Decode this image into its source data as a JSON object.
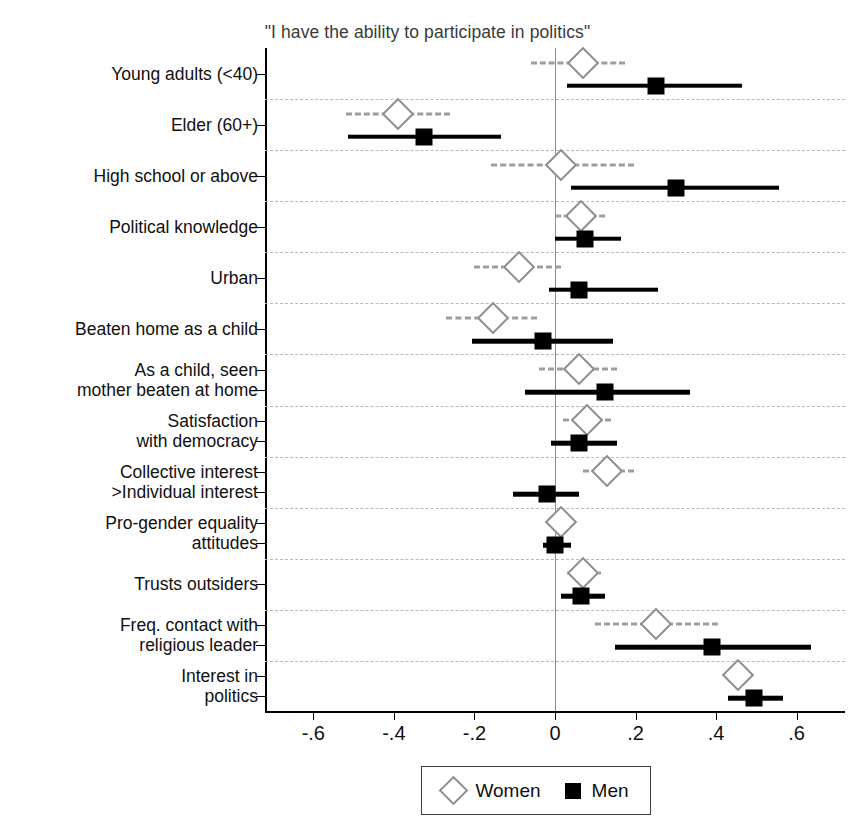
{
  "chart_data": {
    "type": "scatter",
    "title": "\"I have the ability to participate in politics\"",
    "xlabel": "",
    "ylabel": "",
    "xlim": [
      -0.72,
      0.72
    ],
    "xticks": [
      -0.6,
      -0.4,
      -0.2,
      0,
      0.2,
      0.4,
      0.6
    ],
    "xticklabels": [
      "-.6",
      "-.4",
      "-.2",
      "0",
      ".2",
      ".4",
      ".6"
    ],
    "grid": "horizontal-dashed",
    "legend_position": "bottom",
    "zero_reference_line": 0,
    "categories": [
      "Young adults (<40)",
      "Elder (60+)",
      "High school or above",
      "Political knowledge",
      "Urban",
      "Beaten home as a child",
      "As a child, seen\nmother beaten at home",
      "Satisfaction\nwith democracy",
      "Collective interest\n>Individual interest",
      "Pro-gender equality\nattitudes",
      "Trusts outsiders",
      "Freq. contact with\nreligious leader",
      "Interest in\npolitics"
    ],
    "series": [
      {
        "name": "Women",
        "marker": "open-diamond",
        "color": "#8d8d8d",
        "ci_style": "dashed",
        "values": [
          0.07,
          -0.39,
          0.015,
          0.065,
          -0.09,
          -0.155,
          0.06,
          0.08,
          0.13,
          0.015,
          0.07,
          0.25,
          0.455
        ],
        "ci_low": [
          -0.06,
          -0.52,
          -0.16,
          0.0,
          -0.2,
          -0.27,
          -0.04,
          0.02,
          0.07,
          -0.01,
          0.03,
          0.1,
          0.42
        ],
        "ci_high": [
          0.175,
          -0.26,
          0.195,
          0.125,
          0.015,
          -0.045,
          0.155,
          0.14,
          0.195,
          0.045,
          0.115,
          0.405,
          0.49
        ]
      },
      {
        "name": "Men",
        "marker": "filled-square",
        "color": "#000000",
        "ci_style": "solid",
        "values": [
          0.25,
          -0.325,
          0.3,
          0.075,
          0.06,
          -0.03,
          0.125,
          0.06,
          -0.02,
          0.0,
          0.065,
          0.39,
          0.495
        ],
        "ci_low": [
          0.03,
          -0.515,
          0.04,
          0.0,
          -0.015,
          -0.205,
          -0.075,
          -0.01,
          -0.105,
          -0.03,
          0.015,
          0.15,
          0.43
        ],
        "ci_high": [
          0.465,
          -0.135,
          0.555,
          0.165,
          0.255,
          0.145,
          0.335,
          0.155,
          0.06,
          0.04,
          0.125,
          0.635,
          0.565
        ]
      }
    ]
  },
  "legend": {
    "women_label": "Women",
    "men_label": "Men"
  }
}
